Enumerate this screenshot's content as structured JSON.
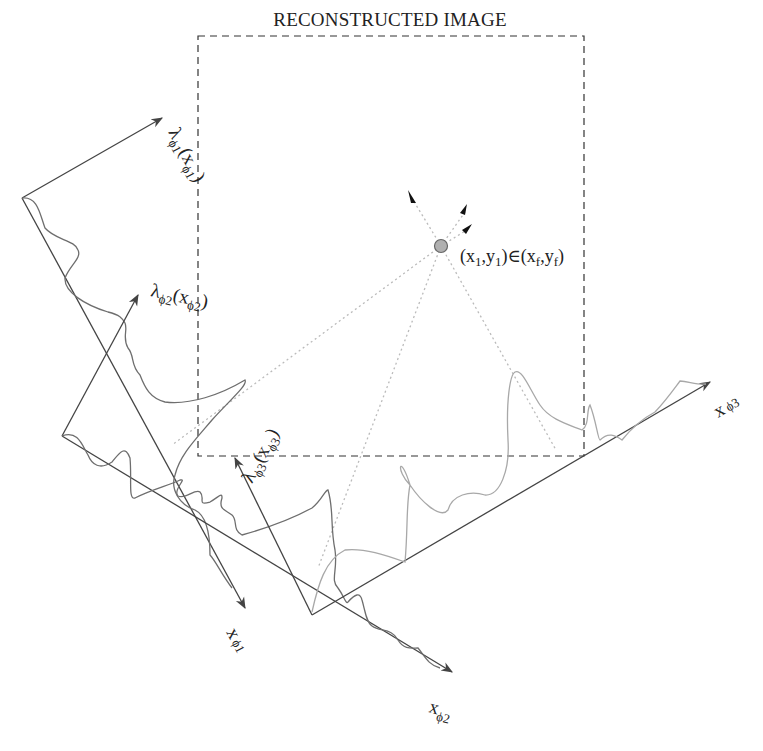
{
  "diagram": {
    "title": "RECONSTRUCTED IMAGE",
    "colors": {
      "axis": "#444444",
      "curve_dark": "#6e6e6e",
      "curve_light": "#a8a8a8",
      "dashed_box": "#333333",
      "dotted_ray": "#bbbbbb",
      "point_fill": "#b0b0b0",
      "point_stroke": "#666666"
    },
    "point": {
      "label_open": "(x",
      "label_sub1": "1",
      "label_mid": ",y",
      "label_sub2": "1",
      "label_rel": ")∈(x",
      "label_subf1": "f",
      "label_comma": ",y",
      "label_subf2": "f",
      "label_close": ")"
    },
    "projections": [
      {
        "id": "phi1",
        "profile_label": "λ",
        "profile_sub": "ϕ1",
        "profile_arg": "(x",
        "profile_arg_sub": "ϕ1",
        "profile_close": ")",
        "axis_label": "x",
        "axis_sub": "ϕ1"
      },
      {
        "id": "phi2",
        "profile_label": "λ",
        "profile_sub": "ϕ2",
        "profile_arg": "(x",
        "profile_arg_sub": "ϕ2",
        "profile_close": ")",
        "axis_label": "x",
        "axis_sub": "ϕ2"
      },
      {
        "id": "phi3",
        "profile_label": "λ",
        "profile_sub": "ϕ3",
        "profile_arg": "(x",
        "profile_arg_sub": "ϕ3",
        "profile_close": ")",
        "axis_label": "x",
        "axis_sub": "ϕ3"
      }
    ]
  }
}
